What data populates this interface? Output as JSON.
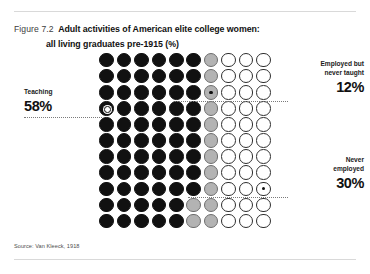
{
  "figure": {
    "number": "Figure 7.2",
    "title_line1": "Adult activities of American elite college women:",
    "title_line2": "all living graduates pre-1915 (%)",
    "source": "Source: Van Kleeck, 1918"
  },
  "callouts": {
    "teaching": {
      "label": "Teaching",
      "value": "58%"
    },
    "employed_never_taught": {
      "label_line1": "Employed but",
      "label_line2": "never taught",
      "value": "12%"
    },
    "never_employed": {
      "label_line1": "Never",
      "label_line2": "employed",
      "value": "30%"
    }
  },
  "colors": {
    "teaching": "#111111",
    "employed_never_taught": "#b3b3b3",
    "never_employed": "#ffffff",
    "outline": "#2e2e2e",
    "rule": "#d9d9d9",
    "leader": "#7a7a7a"
  },
  "chart_data": {
    "type": "waffle",
    "title": "Adult activities of American elite college women: all living graduates pre-1915 (%)",
    "xlabel": "",
    "ylabel": "",
    "grid": {
      "columns": 10,
      "rows": 11,
      "total_dots": 110,
      "dot_unit_percent": 1
    },
    "legend_position": "callouts",
    "categories": [
      "Teaching",
      "Employed but never taught",
      "Never employed"
    ],
    "values": [
      58,
      12,
      30
    ],
    "series": [
      {
        "name": "Teaching",
        "value": 58,
        "color": "#111111",
        "dots": 64
      },
      {
        "name": "Employed but never taught",
        "value": 12,
        "color": "#b3b3b3",
        "dots": 13
      },
      {
        "name": "Never employed",
        "value": 30,
        "color": "#ffffff",
        "dots": 33
      }
    ],
    "annotations": [
      {
        "text": "58%",
        "category": "Teaching",
        "marker_row": 4,
        "marker_col": 1
      },
      {
        "text": "12%",
        "category": "Employed but never taught",
        "marker_row": 3,
        "marker_col": 7
      },
      {
        "text": "30%",
        "category": "Never employed",
        "marker_row": 9,
        "marker_col": 10
      }
    ],
    "rows": [
      [
        "black",
        "black",
        "black",
        "black",
        "black",
        "black",
        "gray",
        "white",
        "white",
        "white"
      ],
      [
        "black",
        "black",
        "black",
        "black",
        "black",
        "black",
        "gray",
        "white",
        "white",
        "white"
      ],
      [
        "black",
        "black",
        "black",
        "black",
        "black",
        "black",
        "gray",
        "white",
        "white",
        "white"
      ],
      [
        "black",
        "black",
        "black",
        "black",
        "black",
        "black",
        "gray",
        "white",
        "white",
        "white"
      ],
      [
        "black",
        "black",
        "black",
        "black",
        "black",
        "black",
        "gray",
        "white",
        "white",
        "white"
      ],
      [
        "black",
        "black",
        "black",
        "black",
        "black",
        "black",
        "gray",
        "white",
        "white",
        "white"
      ],
      [
        "black",
        "black",
        "black",
        "black",
        "black",
        "black",
        "gray",
        "white",
        "white",
        "white"
      ],
      [
        "black",
        "black",
        "black",
        "black",
        "black",
        "black",
        "gray",
        "white",
        "white",
        "white"
      ],
      [
        "black",
        "black",
        "black",
        "black",
        "black",
        "black",
        "gray",
        "white",
        "white",
        "white"
      ],
      [
        "black",
        "black",
        "black",
        "black",
        "black",
        "gray",
        "gray",
        "white",
        "white",
        "white"
      ],
      [
        "black",
        "black",
        "black",
        "black",
        "black",
        "gray",
        "gray",
        "white",
        "white",
        "white"
      ]
    ],
    "marked_cells": [
      {
        "row": 3,
        "col": 0
      },
      {
        "row": 2,
        "col": 6
      },
      {
        "row": 8,
        "col": 9
      }
    ]
  }
}
